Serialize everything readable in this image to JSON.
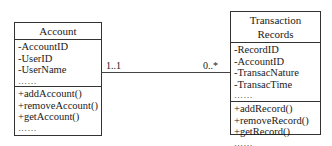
{
  "classes": {
    "account": {
      "name": "Account",
      "attributes": [
        "-AccountID",
        "-UserID",
        "-UserName",
        "……"
      ],
      "methods": [
        "+addAccount()",
        "+removeAccount()",
        "+getAccount()",
        "……"
      ]
    },
    "transaction": {
      "name": "Transaction Records",
      "attributes": [
        "-RecordID",
        "-AccountID",
        "-TransacNature",
        "-TransacTime",
        "……"
      ],
      "methods": [
        "+addRecord()",
        "+removeRecord()",
        "+getRecord()",
        "……"
      ]
    }
  },
  "association": {
    "source_multiplicity": "1..1",
    "target_multiplicity": "0..*"
  }
}
